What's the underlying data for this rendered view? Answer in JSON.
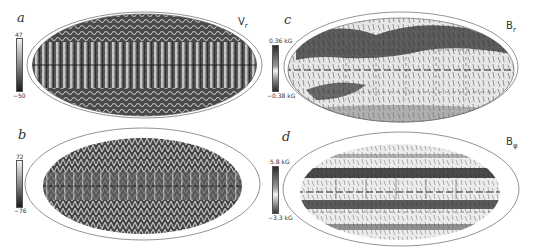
{
  "figure": {
    "panels": [
      {
        "id": "a",
        "letter": "a",
        "variable": "V",
        "variable_sub": "r",
        "colorbar": {
          "max_label": "47",
          "min_label": "−50"
        },
        "scheme": "dark-banded"
      },
      {
        "id": "b",
        "letter": "b",
        "variable": "",
        "variable_sub": "",
        "colorbar": {
          "max_label": "72",
          "min_label": "−76"
        },
        "scheme": "dark-cellular"
      },
      {
        "id": "c",
        "letter": "c",
        "variable": "B",
        "variable_sub": "r",
        "colorbar": {
          "max_label": "0.36 kG",
          "min_label": "−0.38 kG"
        },
        "scheme": "light-patchy"
      },
      {
        "id": "d",
        "letter": "d",
        "variable": "B",
        "variable_sub": "φ",
        "colorbar": {
          "max_label": "5.8 kG",
          "min_label": "−3.3 kG"
        },
        "scheme": "light-striped"
      }
    ]
  }
}
